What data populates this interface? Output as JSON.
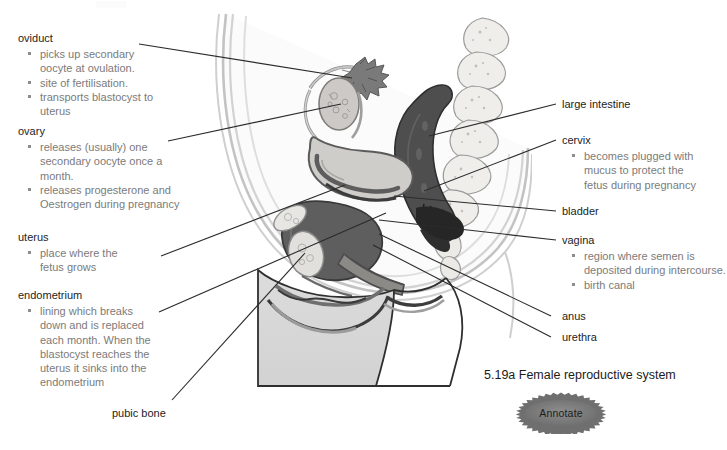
{
  "figure": {
    "caption": "5.19a Female reproductive system",
    "illustration_name": "female-reproductive-system-sagittal-section"
  },
  "button": {
    "annotate_label": "Annotate",
    "shape": "starburst-icon"
  },
  "left_annotations": [
    {
      "id": "oviduct",
      "heading": "oviduct",
      "bullets": [
        [
          "picks up secondary",
          "oocyte at ovulation."
        ],
        [
          "site of fertilisation."
        ],
        [
          "transports blastocyst to",
          "uterus"
        ]
      ]
    },
    {
      "id": "ovary",
      "heading": "ovary",
      "bullets": [
        [
          "releases (usually) one",
          "secondary oocyte once a",
          "month."
        ],
        [
          "releases progesterone and",
          "Oestrogen during pregnancy"
        ]
      ]
    },
    {
      "id": "uterus",
      "heading": "uterus",
      "bullets": [
        [
          "place where the",
          "fetus grows"
        ]
      ]
    },
    {
      "id": "endometrium",
      "heading": "endometrium",
      "bullets": [
        [
          "lining which breaks",
          "down and is replaced",
          "each month. When the",
          "blastocyst reaches the",
          "uterus it sinks into the",
          "endometrium"
        ]
      ]
    },
    {
      "id": "pubic-bone",
      "heading": "pubic bone",
      "bullets": []
    }
  ],
  "right_annotations": [
    {
      "id": "large-intestine",
      "heading": "large intestine",
      "bullets": []
    },
    {
      "id": "cervix",
      "heading": "cervix",
      "bullets": [
        [
          "becomes plugged with",
          "mucus to protect the",
          "fetus during pregnancy"
        ]
      ]
    },
    {
      "id": "bladder",
      "heading": "bladder",
      "bullets": []
    },
    {
      "id": "vagina",
      "heading": "vagina",
      "bullets": [
        [
          "region where semen is",
          "deposited during intercourse."
        ],
        [
          "birth canal"
        ]
      ]
    },
    {
      "id": "anus",
      "heading": "anus",
      "bullets": []
    },
    {
      "id": "urethra",
      "heading": "urethra",
      "bullets": []
    }
  ],
  "colors": {
    "heading_text": "#1d1d1d",
    "bullet_text": "#7b7b7b",
    "leader_line": "#2b2b2b",
    "body_outline": "#b9b9b9",
    "uterus_fill": "#6f6f6f",
    "bladder_fill": "#6b6b6b",
    "intestine_fill": "#4a4a4a",
    "bone_fill": "#e6e4e0",
    "thigh_fill": "#d8d8d8",
    "annotate_fill": "#7d7d7d"
  }
}
